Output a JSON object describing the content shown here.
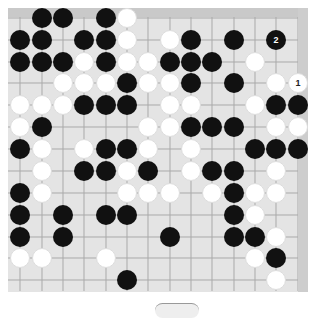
{
  "board": {
    "colors": {
      "background": "#e4e4e4",
      "frame": "#c9c9c9",
      "line": "#a9a9a9",
      "black": "#111111",
      "white": "#ffffff"
    },
    "columns_x": [
      20,
      42,
      63,
      84,
      106,
      127,
      148,
      170,
      191,
      212,
      234,
      255,
      276,
      298
    ],
    "rows_y": [
      18,
      40,
      62,
      83,
      105,
      127,
      149,
      171,
      193,
      215,
      237,
      258,
      280
    ],
    "stones": [
      {
        "r": 0,
        "c": 1,
        "color": "b"
      },
      {
        "r": 0,
        "c": 2,
        "color": "b"
      },
      {
        "r": 0,
        "c": 4,
        "color": "b"
      },
      {
        "r": 0,
        "c": 5,
        "color": "w"
      },
      {
        "r": 1,
        "c": 0,
        "color": "b"
      },
      {
        "r": 1,
        "c": 1,
        "color": "b"
      },
      {
        "r": 1,
        "c": 3,
        "color": "b"
      },
      {
        "r": 1,
        "c": 4,
        "color": "b"
      },
      {
        "r": 1,
        "c": 5,
        "color": "w"
      },
      {
        "r": 1,
        "c": 7,
        "color": "w"
      },
      {
        "r": 1,
        "c": 8,
        "color": "b"
      },
      {
        "r": 1,
        "c": 10,
        "color": "b"
      },
      {
        "r": 1,
        "c": 12,
        "color": "b",
        "label": "2"
      },
      {
        "r": 2,
        "c": 0,
        "color": "b"
      },
      {
        "r": 2,
        "c": 1,
        "color": "b"
      },
      {
        "r": 2,
        "c": 2,
        "color": "b"
      },
      {
        "r": 2,
        "c": 3,
        "color": "w"
      },
      {
        "r": 2,
        "c": 4,
        "color": "b"
      },
      {
        "r": 2,
        "c": 5,
        "color": "w"
      },
      {
        "r": 2,
        "c": 6,
        "color": "w"
      },
      {
        "r": 2,
        "c": 7,
        "color": "b"
      },
      {
        "r": 2,
        "c": 8,
        "color": "b"
      },
      {
        "r": 2,
        "c": 9,
        "color": "b"
      },
      {
        "r": 2,
        "c": 11,
        "color": "w"
      },
      {
        "r": 3,
        "c": 2,
        "color": "w"
      },
      {
        "r": 3,
        "c": 3,
        "color": "w"
      },
      {
        "r": 3,
        "c": 4,
        "color": "w"
      },
      {
        "r": 3,
        "c": 5,
        "color": "b"
      },
      {
        "r": 3,
        "c": 6,
        "color": "w"
      },
      {
        "r": 3,
        "c": 7,
        "color": "w"
      },
      {
        "r": 3,
        "c": 8,
        "color": "b"
      },
      {
        "r": 3,
        "c": 10,
        "color": "b"
      },
      {
        "r": 3,
        "c": 12,
        "color": "w"
      },
      {
        "r": 3,
        "c": 13,
        "color": "w",
        "label": "1"
      },
      {
        "r": 4,
        "c": 0,
        "color": "w"
      },
      {
        "r": 4,
        "c": 1,
        "color": "w"
      },
      {
        "r": 4,
        "c": 2,
        "color": "w"
      },
      {
        "r": 4,
        "c": 3,
        "color": "b"
      },
      {
        "r": 4,
        "c": 4,
        "color": "b"
      },
      {
        "r": 4,
        "c": 5,
        "color": "b"
      },
      {
        "r": 4,
        "c": 7,
        "color": "w"
      },
      {
        "r": 4,
        "c": 8,
        "color": "w"
      },
      {
        "r": 4,
        "c": 11,
        "color": "w"
      },
      {
        "r": 4,
        "c": 12,
        "color": "b"
      },
      {
        "r": 4,
        "c": 13,
        "color": "b"
      },
      {
        "r": 5,
        "c": 0,
        "color": "w"
      },
      {
        "r": 5,
        "c": 1,
        "color": "b"
      },
      {
        "r": 5,
        "c": 6,
        "color": "w"
      },
      {
        "r": 5,
        "c": 7,
        "color": "w"
      },
      {
        "r": 5,
        "c": 8,
        "color": "b"
      },
      {
        "r": 5,
        "c": 9,
        "color": "b"
      },
      {
        "r": 5,
        "c": 10,
        "color": "b"
      },
      {
        "r": 5,
        "c": 12,
        "color": "w"
      },
      {
        "r": 5,
        "c": 13,
        "color": "w"
      },
      {
        "r": 6,
        "c": 0,
        "color": "b"
      },
      {
        "r": 6,
        "c": 1,
        "color": "w"
      },
      {
        "r": 6,
        "c": 3,
        "color": "w"
      },
      {
        "r": 6,
        "c": 4,
        "color": "b"
      },
      {
        "r": 6,
        "c": 5,
        "color": "b"
      },
      {
        "r": 6,
        "c": 6,
        "color": "w"
      },
      {
        "r": 6,
        "c": 8,
        "color": "w"
      },
      {
        "r": 6,
        "c": 11,
        "color": "b"
      },
      {
        "r": 6,
        "c": 12,
        "color": "b"
      },
      {
        "r": 6,
        "c": 13,
        "color": "b"
      },
      {
        "r": 7,
        "c": 1,
        "color": "w"
      },
      {
        "r": 7,
        "c": 3,
        "color": "b"
      },
      {
        "r": 7,
        "c": 4,
        "color": "b"
      },
      {
        "r": 7,
        "c": 5,
        "color": "w"
      },
      {
        "r": 7,
        "c": 6,
        "color": "b"
      },
      {
        "r": 7,
        "c": 8,
        "color": "w"
      },
      {
        "r": 7,
        "c": 9,
        "color": "b"
      },
      {
        "r": 7,
        "c": 10,
        "color": "b"
      },
      {
        "r": 7,
        "c": 12,
        "color": "w"
      },
      {
        "r": 8,
        "c": 0,
        "color": "b"
      },
      {
        "r": 8,
        "c": 1,
        "color": "w"
      },
      {
        "r": 8,
        "c": 5,
        "color": "w"
      },
      {
        "r": 8,
        "c": 6,
        "color": "w"
      },
      {
        "r": 8,
        "c": 7,
        "color": "w"
      },
      {
        "r": 8,
        "c": 9,
        "color": "w"
      },
      {
        "r": 8,
        "c": 10,
        "color": "b"
      },
      {
        "r": 8,
        "c": 11,
        "color": "w"
      },
      {
        "r": 8,
        "c": 12,
        "color": "w"
      },
      {
        "r": 9,
        "c": 0,
        "color": "b"
      },
      {
        "r": 9,
        "c": 2,
        "color": "b"
      },
      {
        "r": 9,
        "c": 4,
        "color": "b"
      },
      {
        "r": 9,
        "c": 5,
        "color": "b"
      },
      {
        "r": 9,
        "c": 10,
        "color": "b"
      },
      {
        "r": 9,
        "c": 11,
        "color": "w"
      },
      {
        "r": 10,
        "c": 0,
        "color": "b"
      },
      {
        "r": 10,
        "c": 2,
        "color": "b"
      },
      {
        "r": 10,
        "c": 7,
        "color": "b"
      },
      {
        "r": 10,
        "c": 10,
        "color": "b"
      },
      {
        "r": 10,
        "c": 11,
        "color": "b"
      },
      {
        "r": 10,
        "c": 12,
        "color": "w"
      },
      {
        "r": 11,
        "c": 0,
        "color": "w"
      },
      {
        "r": 11,
        "c": 1,
        "color": "w"
      },
      {
        "r": 11,
        "c": 4,
        "color": "w"
      },
      {
        "r": 11,
        "c": 11,
        "color": "w"
      },
      {
        "r": 11,
        "c": 12,
        "color": "b"
      },
      {
        "r": 12,
        "c": 5,
        "color": "b"
      },
      {
        "r": 12,
        "c": 12,
        "color": "w"
      }
    ]
  }
}
